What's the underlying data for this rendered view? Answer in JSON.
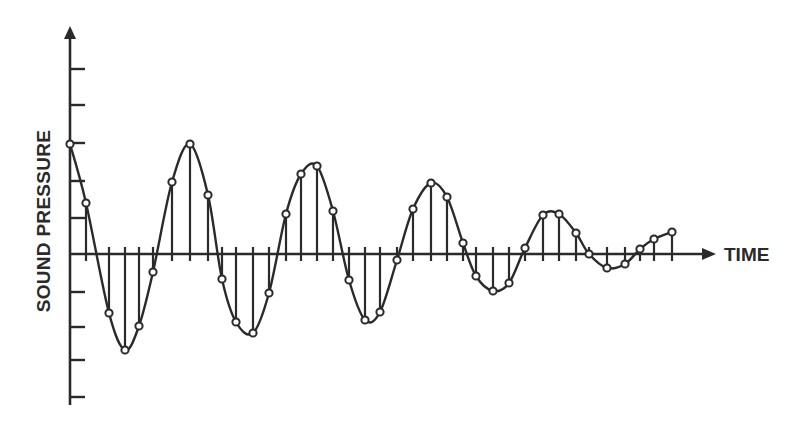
{
  "chart_data": {
    "type": "line",
    "subtype": "sampled-waveform-with-stems",
    "title": "",
    "xlabel": "TIME",
    "ylabel": "SOUND PRESSURE",
    "grid": false,
    "legend": null,
    "ylim": [
      -4,
      6
    ],
    "y_ticks": [
      -4,
      -3,
      -2,
      -1,
      1,
      2,
      3,
      4,
      5
    ],
    "y_tick_labels_shown": false,
    "x_tick_labels_shown": false,
    "series": [
      {
        "name": "samples",
        "marker": "open-circle",
        "stems": true,
        "x": [
          0,
          1,
          2,
          3,
          4,
          5,
          6,
          7,
          8,
          9,
          10,
          11,
          12,
          13,
          14,
          15,
          16,
          17,
          18,
          19,
          20,
          21,
          22,
          23,
          24,
          25,
          26,
          27,
          28,
          29,
          30,
          31,
          32,
          33,
          34,
          35,
          36,
          37
        ],
        "values": [
          2.97,
          1.38,
          -1.59,
          -2.59,
          -1.95,
          -0.49,
          1.95,
          2.97,
          1.59,
          -0.68,
          -1.84,
          -2.14,
          -1.05,
          1.08,
          2.16,
          2.38,
          1.16,
          -0.7,
          -1.78,
          -1.57,
          -0.16,
          1.22,
          1.92,
          1.54,
          0.3,
          -0.59,
          -1.0,
          -0.78,
          0.16,
          1.05,
          1.08,
          0.57,
          0.0,
          -0.38,
          -0.27,
          0.14,
          0.41,
          0.59
        ]
      }
    ],
    "pixel_points": [
      [
        70,
        144
      ],
      [
        86,
        203
      ],
      [
        109,
        313
      ],
      [
        125,
        350
      ],
      [
        139,
        326
      ],
      [
        153,
        272
      ],
      [
        172,
        182
      ],
      [
        190,
        144
      ],
      [
        208,
        195
      ],
      [
        222,
        279
      ],
      [
        236,
        322
      ],
      [
        253,
        333
      ],
      [
        269,
        293
      ],
      [
        286,
        214
      ],
      [
        301,
        174
      ],
      [
        317,
        166
      ],
      [
        333,
        211
      ],
      [
        349,
        280
      ],
      [
        365,
        320
      ],
      [
        380,
        312
      ],
      [
        397,
        260
      ],
      [
        413,
        209
      ],
      [
        431,
        183
      ],
      [
        447,
        197
      ],
      [
        463,
        243
      ],
      [
        476,
        276
      ],
      [
        493,
        291
      ],
      [
        509,
        283
      ],
      [
        525,
        248
      ],
      [
        543,
        215
      ],
      [
        559,
        214
      ],
      [
        576,
        233
      ],
      [
        589,
        254
      ],
      [
        607,
        268
      ],
      [
        625,
        264
      ],
      [
        640,
        249
      ],
      [
        654,
        239
      ],
      [
        672,
        232
      ]
    ],
    "axes_px": {
      "origin": [
        70,
        254
      ],
      "y_top": 26,
      "y_bottom": 405,
      "x_right": 716,
      "y_tick_px": [
        69,
        105,
        143,
        181,
        218,
        292,
        327,
        360,
        397
      ]
    },
    "colors": {
      "ink": "#2a2a2a",
      "background": "#ffffff"
    }
  }
}
